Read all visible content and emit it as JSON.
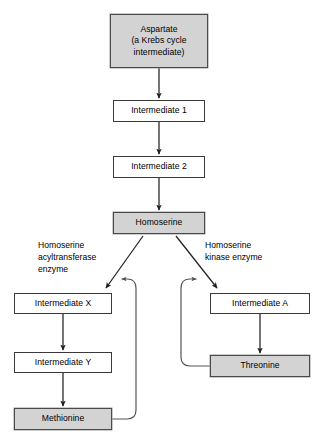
{
  "diagram": {
    "canvas": {
      "width": 322,
      "height": 443,
      "background": "#ffffff"
    },
    "colors": {
      "shaded_fill": "#d3d3d3",
      "plain_fill": "#ffffff",
      "stroke": "#3a3a3a",
      "text": "#000000"
    },
    "nodes": [
      {
        "id": "aspartate",
        "label": "Aspartate\n(a Krebs cycle\nintermediate)",
        "style": "shaded",
        "x": 110,
        "y": 14,
        "w": 98,
        "h": 54
      },
      {
        "id": "intermediate1",
        "label": "Intermediate 1",
        "style": "plain",
        "x": 113,
        "y": 100,
        "w": 92,
        "h": 22
      },
      {
        "id": "intermediate2",
        "label": "Intermediate 2",
        "style": "plain",
        "x": 113,
        "y": 156,
        "w": 92,
        "h": 22
      },
      {
        "id": "homoserine",
        "label": "Homoserine",
        "style": "shaded",
        "x": 113,
        "y": 212,
        "w": 92,
        "h": 22
      },
      {
        "id": "intermediatex",
        "label": "Intermediate X",
        "style": "plain",
        "x": 14,
        "y": 293,
        "w": 98,
        "h": 21
      },
      {
        "id": "intermediatey",
        "label": "Intermediate Y",
        "style": "plain",
        "x": 14,
        "y": 352,
        "w": 98,
        "h": 21
      },
      {
        "id": "methionine",
        "label": "Methionine",
        "style": "shaded",
        "x": 14,
        "y": 408,
        "w": 98,
        "h": 22
      },
      {
        "id": "intermediatea",
        "label": "Intermediate A",
        "style": "plain",
        "x": 210,
        "y": 293,
        "w": 100,
        "h": 21
      },
      {
        "id": "threonine",
        "label": "Threonine",
        "style": "shaded",
        "x": 210,
        "y": 355,
        "w": 100,
        "h": 22
      }
    ],
    "edge_labels": [
      {
        "id": "left-enzyme",
        "text": "Homoserine\nacyltransferase\nenzyme",
        "x": 38,
        "y": 239
      },
      {
        "id": "right-enzyme",
        "text": "Homoserine\nkinase enzyme",
        "x": 205,
        "y": 239
      }
    ],
    "edges": [
      {
        "id": "aspartate-to-intermediate1",
        "from": "aspartate",
        "to": "intermediate1",
        "kind": "arrow"
      },
      {
        "id": "intermediate1-to-intermediate2",
        "from": "intermediate1",
        "to": "intermediate2",
        "kind": "arrow"
      },
      {
        "id": "intermediate2-to-homoserine",
        "from": "intermediate2",
        "to": "homoserine",
        "kind": "arrow"
      },
      {
        "id": "homoserine-to-intermediatex",
        "from": "homoserine",
        "to": "intermediatex",
        "kind": "arrow"
      },
      {
        "id": "homoserine-to-intermediatea",
        "from": "homoserine",
        "to": "intermediatea",
        "kind": "arrow"
      },
      {
        "id": "intermediatex-to-intermediatey",
        "from": "intermediatex",
        "to": "intermediatey",
        "kind": "arrow"
      },
      {
        "id": "intermediatey-to-methionine",
        "from": "intermediatey",
        "to": "methionine",
        "kind": "arrow"
      },
      {
        "id": "intermediatea-to-threonine",
        "from": "intermediatea",
        "to": "threonine",
        "kind": "arrow"
      },
      {
        "id": "methionine-feedback",
        "from": "methionine",
        "to": "homoserine-to-intermediatex",
        "kind": "feedback-arrow"
      },
      {
        "id": "threonine-feedback",
        "from": "threonine",
        "to": "homoserine-to-intermediatea",
        "kind": "feedback-arrow"
      }
    ]
  }
}
